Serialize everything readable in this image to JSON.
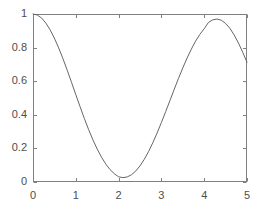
{
  "chart_data": {
    "type": "line",
    "title": "",
    "subtitle": "",
    "xlabel": "",
    "ylabel": "",
    "xlim": [
      0,
      5
    ],
    "ylim": [
      0,
      1
    ],
    "xticks": [
      0,
      1,
      2,
      3,
      4,
      5
    ],
    "yticks": [
      0,
      0.2,
      0.4,
      0.6,
      0.8,
      1
    ],
    "xtick_labels": [
      "0",
      "1",
      "2",
      "3",
      "4",
      "5"
    ],
    "ytick_labels": [
      "0",
      "0.2",
      "0.4",
      "0.6",
      "0.8",
      "1"
    ],
    "grid": false,
    "legend": null,
    "legend_position": "none",
    "box": true,
    "tick_direction": "in",
    "line_color": "#666666",
    "line_width": 1,
    "axis_color": "#808080",
    "background_color": "#ffffff",
    "series": [
      {
        "name": "curve",
        "x": [
          0,
          0.1,
          0.2,
          0.3,
          0.4,
          0.5,
          0.6,
          0.7,
          0.8,
          0.9,
          1,
          1.1,
          1.2,
          1.3,
          1.4,
          1.5,
          1.6,
          1.7,
          1.8,
          1.9,
          2,
          2.1,
          2.2,
          2.3,
          2.4,
          2.5,
          2.6,
          2.7,
          2.8,
          2.9,
          3,
          3.1,
          3.2,
          3.3,
          3.4,
          3.5,
          3.6,
          3.7,
          3.8,
          3.9,
          4,
          4.1,
          4.2,
          4.3,
          4.4,
          4.5,
          4.6,
          4.7,
          4.8,
          4.9,
          5
        ],
        "y": [
          1,
          0.994,
          0.976,
          0.946,
          0.906,
          0.856,
          0.798,
          0.734,
          0.665,
          0.593,
          0.52,
          0.448,
          0.378,
          0.312,
          0.251,
          0.196,
          0.148,
          0.107,
          0.074,
          0.049,
          0.031,
          0.026,
          0.03,
          0.043,
          0.065,
          0.096,
          0.135,
          0.181,
          0.234,
          0.292,
          0.354,
          0.419,
          0.485,
          0.552,
          0.617,
          0.679,
          0.738,
          0.791,
          0.839,
          0.879,
          0.912,
          0.95,
          0.965,
          0.97,
          0.963,
          0.944,
          0.915,
          0.875,
          0.827,
          0.772,
          0.713
        ]
      }
    ],
    "annotations": []
  },
  "figure": {
    "axes_left_px": 33,
    "axes_right_px": 247,
    "axes_top_px": 14,
    "axes_bottom_px": 182
  }
}
